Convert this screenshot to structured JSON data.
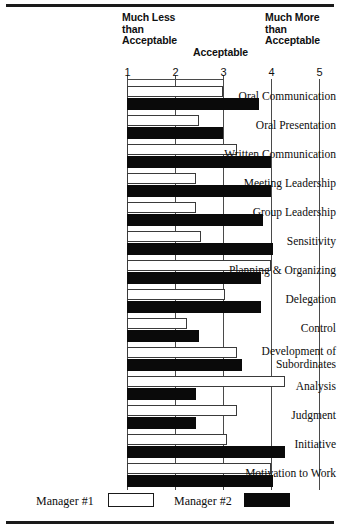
{
  "header": {
    "much_less": "Much Less than Acceptable",
    "acceptable": "Acceptable",
    "much_more": "Much More than Acceptable"
  },
  "legend": {
    "series1_label": "Manager #1",
    "series2_label": "Manager #2",
    "series1_color": "#ffffff",
    "series2_color": "#0a0a0a"
  },
  "chart_data": {
    "type": "bar",
    "orientation": "horizontal",
    "title": "",
    "xlabel": "",
    "ylabel": "",
    "xlim": [
      1,
      5
    ],
    "xticks": [
      1,
      2,
      3,
      4,
      5
    ],
    "xtick_labels": [
      "1",
      "2",
      "3",
      "4",
      "5"
    ],
    "grid": true,
    "legend_position": "bottom",
    "annotations": [
      {
        "text": "Much Less than Acceptable",
        "at_x": 1
      },
      {
        "text": "Acceptable",
        "at_x": 3
      },
      {
        "text": "Much More than Acceptable",
        "at_x": 4
      }
    ],
    "categories": [
      "Oral Communication",
      "Oral Presentation",
      "Written Communication",
      "Meeting Leadership",
      "Group Leadership",
      "Sensitivity",
      "Planning & Organizing",
      "Delegation",
      "Control",
      "Development of Subordinates",
      "Analysis",
      "Judgment",
      "Initiative",
      "Motivation to Work"
    ],
    "series": [
      {
        "name": "Manager #1",
        "color": "#ffffff",
        "values": [
          3.0,
          2.5,
          3.3,
          2.45,
          2.45,
          2.55,
          4.0,
          3.05,
          2.25,
          3.3,
          4.3,
          3.3,
          3.1,
          4.0
        ]
      },
      {
        "name": "Manager #2",
        "color": "#0a0a0a",
        "values": [
          3.75,
          3.0,
          4.0,
          4.0,
          3.85,
          4.05,
          3.8,
          3.8,
          2.5,
          3.4,
          2.45,
          2.45,
          4.3,
          4.05
        ]
      }
    ]
  }
}
